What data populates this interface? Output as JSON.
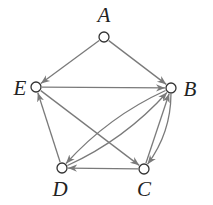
{
  "diagram": {
    "type": "directed-graph",
    "edge_color": "#7a7a7a",
    "node_stroke": "#333333",
    "nodes": [
      {
        "id": "A",
        "label": "A",
        "x": 104,
        "y": 37,
        "lx": 104,
        "ly": 22
      },
      {
        "id": "B",
        "label": "B",
        "x": 171,
        "y": 88,
        "lx": 190,
        "ly": 96
      },
      {
        "id": "C",
        "label": "C",
        "x": 144,
        "y": 169,
        "lx": 144,
        "ly": 196
      },
      {
        "id": "D",
        "label": "D",
        "x": 62,
        "y": 168,
        "lx": 60,
        "ly": 196
      },
      {
        "id": "E",
        "label": "E",
        "x": 36,
        "y": 87,
        "lx": 20,
        "ly": 95
      }
    ],
    "edges": [
      {
        "from": "A",
        "to": "E",
        "curve": 0
      },
      {
        "from": "A",
        "to": "B",
        "curve": 0
      },
      {
        "from": "E",
        "to": "B",
        "curve": 0
      },
      {
        "from": "E",
        "to": "C",
        "curve": 0
      },
      {
        "from": "D",
        "to": "E",
        "curve": 0
      },
      {
        "from": "C",
        "to": "D",
        "curve": 0
      },
      {
        "from": "C",
        "to": "B",
        "curve": 0
      },
      {
        "from": "B",
        "to": "C",
        "curve": -14
      },
      {
        "from": "D",
        "to": "B",
        "curve": 14
      },
      {
        "from": "B",
        "to": "D",
        "curve": 14
      }
    ]
  }
}
